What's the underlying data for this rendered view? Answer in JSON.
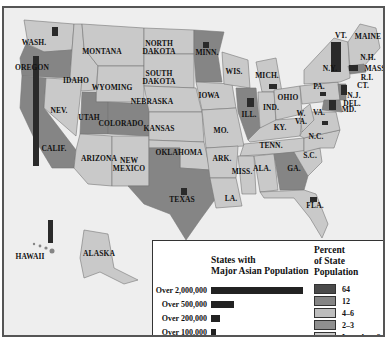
{
  "map": {
    "title": "States with Major Asian Population",
    "colors": {
      "pct64": "#4a4a4a",
      "pct12": "#858585",
      "pct4_6": "#bdbdbd",
      "pct2_3": "#8f8f8f",
      "pctLess2": "#c9c9c9",
      "water": "#eeeeee",
      "bar": "#2a2a2a"
    },
    "state_labels": [
      {
        "name": "WASH.",
        "x": 30,
        "y": 37
      },
      {
        "name": "OREGON",
        "x": 28,
        "y": 62
      },
      {
        "name": "IDAHO",
        "x": 72,
        "y": 75
      },
      {
        "name": "MONTANA",
        "x": 98,
        "y": 46
      },
      {
        "name": "NORTH DAKOTA",
        "x": 155,
        "y": 38
      },
      {
        "name": "SOUTH DAKOTA",
        "x": 155,
        "y": 68
      },
      {
        "name": "WYOMING",
        "x": 108,
        "y": 82
      },
      {
        "name": "MINN.",
        "x": 203,
        "y": 47
      },
      {
        "name": "WIS.",
        "x": 230,
        "y": 66
      },
      {
        "name": "MICH.",
        "x": 263,
        "y": 70
      },
      {
        "name": "NEBRASKA",
        "x": 148,
        "y": 96
      },
      {
        "name": "IOWA",
        "x": 205,
        "y": 90
      },
      {
        "name": "NEV.",
        "x": 55,
        "y": 105
      },
      {
        "name": "UTAH",
        "x": 85,
        "y": 112
      },
      {
        "name": "COLORADO",
        "x": 117,
        "y": 118
      },
      {
        "name": "KANSAS",
        "x": 155,
        "y": 123
      },
      {
        "name": "ILL.",
        "x": 245,
        "y": 109
      },
      {
        "name": "IND.",
        "x": 267,
        "y": 102
      },
      {
        "name": "OHIO",
        "x": 284,
        "y": 92
      },
      {
        "name": "MO.",
        "x": 217,
        "y": 125
      },
      {
        "name": "CALIF.",
        "x": 50,
        "y": 143
      },
      {
        "name": "ARIZONA",
        "x": 95,
        "y": 153
      },
      {
        "name": "NEW MEXICO",
        "x": 125,
        "y": 155
      },
      {
        "name": "OKLAHOMA",
        "x": 175,
        "y": 147
      },
      {
        "name": "ARK.",
        "x": 218,
        "y": 153
      },
      {
        "name": "TENN.",
        "x": 267,
        "y": 140
      },
      {
        "name": "MISS.",
        "x": 238,
        "y": 166
      },
      {
        "name": "ALA.",
        "x": 258,
        "y": 163
      },
      {
        "name": "GA.",
        "x": 290,
        "y": 163
      },
      {
        "name": "S.C.",
        "x": 306,
        "y": 150
      },
      {
        "name": "N.C.",
        "x": 312,
        "y": 131
      },
      {
        "name": "KY.",
        "x": 276,
        "y": 122
      },
      {
        "name": "W. VA.",
        "x": 297,
        "y": 108
      },
      {
        "name": "VA.",
        "x": 315,
        "y": 107
      },
      {
        "name": "TEXAS",
        "x": 178,
        "y": 194
      },
      {
        "name": "LA.",
        "x": 227,
        "y": 193
      },
      {
        "name": "FLA.",
        "x": 311,
        "y": 200
      },
      {
        "name": "PA.",
        "x": 315,
        "y": 81
      },
      {
        "name": "N.Y.",
        "x": 326,
        "y": 63
      },
      {
        "name": "VT.",
        "x": 337,
        "y": 30
      },
      {
        "name": "MAINE",
        "x": 364,
        "y": 31
      },
      {
        "name": "N.H.",
        "x": 364,
        "y": 52
      },
      {
        "name": "MASS.",
        "x": 372,
        "y": 63
      },
      {
        "name": "R.I.",
        "x": 363,
        "y": 72
      },
      {
        "name": "CT.",
        "x": 359,
        "y": 80
      },
      {
        "name": "N.J.",
        "x": 350,
        "y": 90
      },
      {
        "name": "DEL.",
        "x": 348,
        "y": 98
      },
      {
        "name": "MD.",
        "x": 345,
        "y": 104
      },
      {
        "name": "HAWAII",
        "x": 26,
        "y": 251
      },
      {
        "name": "ALASKA",
        "x": 95,
        "y": 248
      }
    ],
    "state_bars": [
      {
        "state": "WASH.",
        "x": 48,
        "y": 19,
        "w": 6,
        "h": 9
      },
      {
        "state": "OREGON",
        "x": 29,
        "y": 48,
        "w": 6,
        "h": 110
      },
      {
        "state": "MINN.",
        "x": 199,
        "y": 34,
        "w": 6,
        "h": 6
      },
      {
        "state": "MICH.",
        "x": 265,
        "y": 76,
        "w": 8,
        "h": 5
      },
      {
        "state": "ILL.",
        "x": 243,
        "y": 90,
        "w": 7,
        "h": 9
      },
      {
        "state": "N.Y.",
        "x": 327,
        "y": 34,
        "w": 10,
        "h": 30
      },
      {
        "state": "MASS.",
        "x": 345,
        "y": 57,
        "w": 9,
        "h": 6
      },
      {
        "state": "N.J.",
        "x": 337,
        "y": 77,
        "w": 6,
        "h": 10
      },
      {
        "state": "MD.",
        "x": 325,
        "y": 92,
        "w": 7,
        "h": 10
      },
      {
        "state": "PA.",
        "x": 316,
        "y": 84,
        "w": 6,
        "h": 4
      },
      {
        "state": "VA.",
        "x": 318,
        "y": 113,
        "w": 6,
        "h": 4
      },
      {
        "state": "TEXAS",
        "x": 177,
        "y": 180,
        "w": 6,
        "h": 7
      },
      {
        "state": "FLA.",
        "x": 306,
        "y": 189,
        "w": 7,
        "h": 5
      },
      {
        "state": "HAWAII",
        "x": 44,
        "y": 212,
        "w": 5,
        "h": 23
      }
    ]
  },
  "legend_population": {
    "title_line1": "States with",
    "title_line2": "Major Asian Population",
    "rows": [
      {
        "label": "Over 2,000,000",
        "bar_width": 92
      },
      {
        "label": "Over 500,000",
        "bar_width": 23
      },
      {
        "label": "Over 200,000",
        "bar_width": 9
      },
      {
        "label": "Over 100,000",
        "bar_width": 5
      }
    ]
  },
  "legend_percent": {
    "title_line1": "Percent",
    "title_line2": "of State",
    "title_line3": "Population",
    "rows": [
      {
        "label": "64",
        "color": "#4a4a4a"
      },
      {
        "label": "12",
        "color": "#858585"
      },
      {
        "label": "4–6",
        "color": "#bdbdbd"
      },
      {
        "label": "2–3",
        "color": "#8f8f8f"
      },
      {
        "label": "Less than 2",
        "color": "#c9c9c9"
      }
    ]
  }
}
